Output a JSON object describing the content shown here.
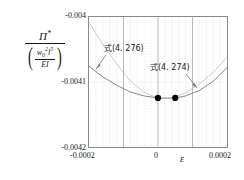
{
  "chart_data": {
    "type": "line",
    "title": "",
    "xlabel": "ε",
    "ylabel_numerator": "Π*",
    "ylabel_denominator": "(w₀²l⁵ / EI)",
    "xlim": [
      -0.0002,
      0.0002
    ],
    "ylim": [
      -0.0042,
      -0.004
    ],
    "xticks": [
      "-0.0002",
      "0",
      "0.0002"
    ],
    "xtick_values": [
      -0.0002,
      0,
      0.0002
    ],
    "yticks": [
      "-0.004",
      "-0.0041",
      "-0.0042"
    ],
    "ytick_values": [
      -0.004,
      -0.0041,
      -0.0042
    ],
    "grid": "vertical dotted minor gridlines, solid major gridlines",
    "legend": "inline annotations with arrows",
    "series": [
      {
        "name": "式(4. 274)",
        "style": "solid",
        "color": "#8a8a8a",
        "x": [
          -0.0002,
          -0.00016,
          -0.00012,
          -8e-05,
          -4e-05,
          0.0,
          2e-05,
          5e-05,
          8e-05,
          0.00012,
          0.00016,
          0.0002
        ],
        "y": [
          -0.004076,
          -0.004092,
          -0.004105,
          -0.0041155,
          -0.0041215,
          -0.0041245,
          -0.004125,
          -0.0041245,
          -0.0041215,
          -0.004113,
          -0.004099,
          -0.004078
        ]
      },
      {
        "name": "式(4. 276)",
        "style": "dotted",
        "color": "#b0b0b0",
        "x": [
          -0.0002,
          -0.00016,
          -0.00012,
          -8e-05,
          -4e-05,
          0.0,
          4e-05,
          8e-05,
          0.00012,
          0.00016,
          0.0002
        ],
        "y": [
          -0.004008,
          -0.004042,
          -0.004072,
          -0.0040985,
          -0.004116,
          -0.0041245,
          -0.0041245,
          -0.004117,
          -0.004103,
          -0.004085,
          -0.004062
        ]
      }
    ],
    "markers": [
      {
        "x": 0.0,
        "y": -0.0041245,
        "shape": "filled-circle",
        "color": "#000000"
      },
      {
        "x": 5e-05,
        "y": -0.0041245,
        "shape": "filled-circle",
        "color": "#000000"
      }
    ],
    "annotations": [
      {
        "label": "式(4. 276)",
        "target_series": "式(4. 276)",
        "arrow": "down-left"
      },
      {
        "label": "式(4. 274)",
        "target_series": "式(4. 274)",
        "arrow": "down-right"
      }
    ]
  },
  "axes": {
    "y_numerator_symbol": "Π",
    "y_numerator_star": "*",
    "y_den_w": "w",
    "y_den_w_sub": "0",
    "y_den_w_sup": "2",
    "y_den_l": "l",
    "y_den_l_sup": "5",
    "y_den_EI": "EI",
    "ytick_top": "-0.004",
    "ytick_mid": "-0.0041",
    "ytick_bottom": "-0.0042",
    "xtick_left": "-0.0002",
    "xtick_mid": "0",
    "xtick_right": "0.0002",
    "x_symbol": "ε"
  },
  "annotations": {
    "label_276": "式(4. 276)",
    "label_274": "式(4. 274)"
  }
}
